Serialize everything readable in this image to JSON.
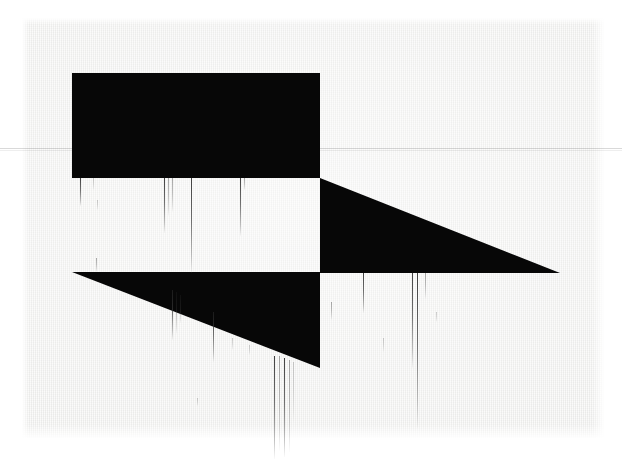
{
  "artwork": {
    "title": "Untitled — two black triangles with ink drips",
    "medium": "screenprint on paper",
    "background_color": "#ffffff",
    "paper_color": "#f2f2f1",
    "ink_color": "#070707",
    "drip_color": "#3a3a3a",
    "canvas": {
      "width": 622,
      "height": 459
    },
    "paper_bounds": {
      "x": 22,
      "y": 18,
      "width": 582,
      "height": 420
    }
  },
  "shapes": [
    {
      "name": "upper-triangle",
      "kind": "polygon",
      "color": "#070707",
      "points": "72,73 320,73 320,178 72,178",
      "description": "upper-left black wedge, flat top-left going to diagonal"
    },
    {
      "name": "diagonal-wedge",
      "kind": "polygon",
      "color": "#070707",
      "points": "320,178 560,273 320,273",
      "description": "long right-pointing wedge tapering to a point at right"
    },
    {
      "name": "lower-triangle",
      "kind": "polygon",
      "color": "#070707",
      "points": "72,272 320,272 320,368",
      "description": "lower-left black wedge, flat top, hypotenuse down-right"
    }
  ],
  "marks": {
    "scan_line_y": 148,
    "drips_top_band": [
      {
        "x": 80,
        "y": 178,
        "length": 28,
        "weight": 1,
        "opacity": "normal"
      },
      {
        "x": 93,
        "y": 178,
        "length": 12,
        "weight": 1,
        "opacity": "vfaint"
      },
      {
        "x": 97,
        "y": 200,
        "length": 10,
        "weight": 1,
        "opacity": "vfaint"
      },
      {
        "x": 164,
        "y": 178,
        "length": 55,
        "weight": 1,
        "opacity": "normal"
      },
      {
        "x": 168,
        "y": 178,
        "length": 38,
        "weight": 1,
        "opacity": "faint"
      },
      {
        "x": 172,
        "y": 178,
        "length": 34,
        "weight": 1,
        "opacity": "faint"
      },
      {
        "x": 191,
        "y": 178,
        "length": 95,
        "weight": 1,
        "opacity": "normal"
      },
      {
        "x": 240,
        "y": 178,
        "length": 58,
        "weight": 1,
        "opacity": "normal"
      },
      {
        "x": 244,
        "y": 178,
        "length": 12,
        "weight": 1,
        "opacity": "faint"
      },
      {
        "x": 96,
        "y": 258,
        "length": 14,
        "weight": 1,
        "opacity": "faint"
      }
    ],
    "drips_lower_band": [
      {
        "x": 172,
        "y": 290,
        "length": 50,
        "weight": 1,
        "opacity": "normal"
      },
      {
        "x": 176,
        "y": 292,
        "length": 42,
        "weight": 1,
        "opacity": "faint"
      },
      {
        "x": 180,
        "y": 295,
        "length": 28,
        "weight": 1,
        "opacity": "faint"
      },
      {
        "x": 213,
        "y": 312,
        "length": 50,
        "weight": 1,
        "opacity": "normal"
      },
      {
        "x": 232,
        "y": 338,
        "length": 12,
        "weight": 1,
        "opacity": "vfaint"
      },
      {
        "x": 249,
        "y": 345,
        "length": 10,
        "weight": 1,
        "opacity": "vfaint"
      },
      {
        "x": 274,
        "y": 356,
        "length": 103,
        "weight": 1,
        "opacity": "normal"
      },
      {
        "x": 279,
        "y": 356,
        "length": 95,
        "weight": 1,
        "opacity": "faint"
      },
      {
        "x": 284,
        "y": 358,
        "length": 99,
        "weight": 1,
        "opacity": "normal"
      },
      {
        "x": 289,
        "y": 360,
        "length": 92,
        "weight": 1,
        "opacity": "faint"
      },
      {
        "x": 293,
        "y": 362,
        "length": 60,
        "weight": 1,
        "opacity": "vfaint"
      },
      {
        "x": 197,
        "y": 398,
        "length": 8,
        "weight": 1,
        "opacity": "vfaint"
      }
    ],
    "drips_right_band": [
      {
        "x": 363,
        "y": 273,
        "length": 40,
        "weight": 1,
        "opacity": "normal"
      },
      {
        "x": 331,
        "y": 302,
        "length": 18,
        "weight": 1,
        "opacity": "faint"
      },
      {
        "x": 383,
        "y": 338,
        "length": 14,
        "weight": 1,
        "opacity": "vfaint"
      },
      {
        "x": 412,
        "y": 273,
        "length": 95,
        "weight": 1,
        "opacity": "normal"
      },
      {
        "x": 417,
        "y": 273,
        "length": 155,
        "weight": 1,
        "opacity": "normal"
      },
      {
        "x": 425,
        "y": 273,
        "length": 26,
        "weight": 1,
        "opacity": "faint"
      },
      {
        "x": 436,
        "y": 312,
        "length": 10,
        "weight": 1,
        "opacity": "vfaint"
      }
    ]
  }
}
